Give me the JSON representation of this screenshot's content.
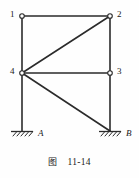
{
  "figure": {
    "caption_label": "图",
    "caption_number": "11-14",
    "caption_full": "图  11-14"
  },
  "diagram": {
    "type": "plane-truss-frame",
    "stroke_color": "#2b2b2b",
    "background_color": "#fefefe",
    "node_fill_color": "#ffffff",
    "nodes": [
      {
        "id": "1",
        "label": "1",
        "x": 22,
        "y": 16,
        "label_x": 11,
        "label_y": 11
      },
      {
        "id": "2",
        "label": "2",
        "x": 110,
        "y": 16,
        "label_x": 117,
        "label_y": 11
      },
      {
        "id": "3",
        "label": "3",
        "x": 110,
        "y": 73,
        "label_x": 117,
        "label_y": 68
      },
      {
        "id": "4",
        "label": "4",
        "x": 22,
        "y": 73,
        "label_x": 11,
        "label_y": 68
      }
    ],
    "members": [
      {
        "name": "top-chord-1-2",
        "from": "1",
        "to": "2"
      },
      {
        "name": "left-column-1-4",
        "from": "1",
        "to": "4"
      },
      {
        "name": "right-column-2-3",
        "from": "2",
        "to": "3"
      },
      {
        "name": "diagonal-4-2",
        "from": "4",
        "to": "2"
      },
      {
        "name": "middle-chord-4-3",
        "from": "4",
        "to": "3"
      },
      {
        "name": "left-column-4-A",
        "from": "4",
        "to": "A"
      },
      {
        "name": "right-column-3-B",
        "from": "3",
        "to": "B"
      },
      {
        "name": "diagonal-4-B",
        "from": "4",
        "to": "B"
      }
    ],
    "supports": [
      {
        "id": "A",
        "label": "A",
        "x": 22,
        "y": 131,
        "label_x": 37,
        "label_y": 133
      },
      {
        "id": "B",
        "label": "B",
        "x": 110,
        "y": 131,
        "label_x": 125,
        "label_y": 133
      }
    ]
  }
}
